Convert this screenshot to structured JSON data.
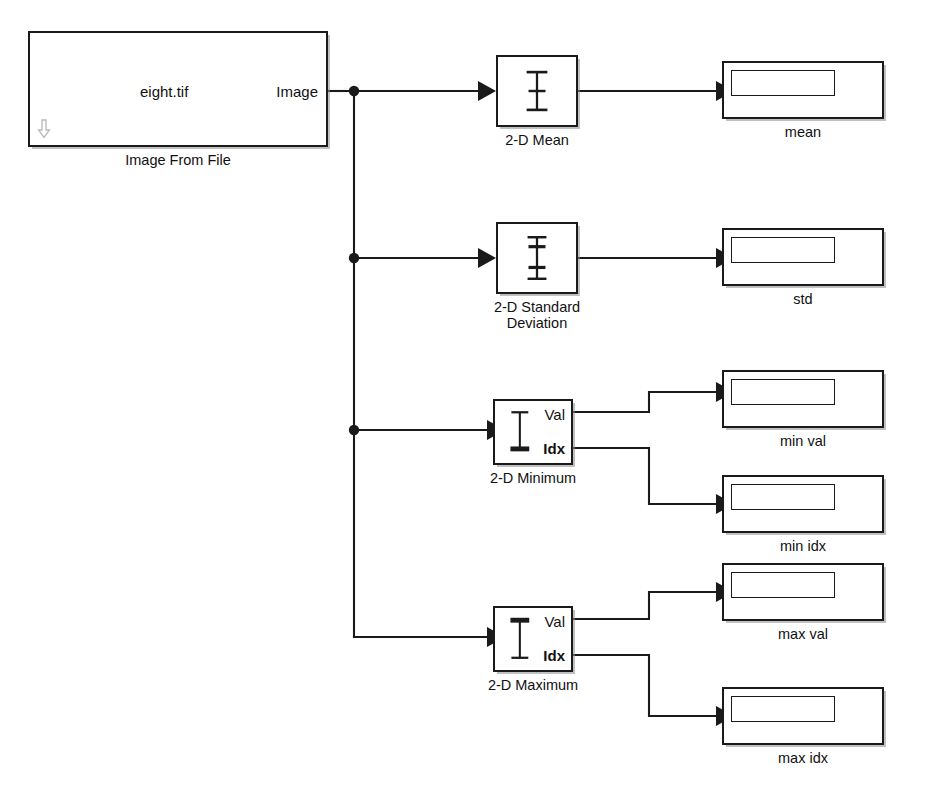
{
  "diagram": {
    "background_color": "#ffffff",
    "line_color": "#1a1a1a"
  },
  "source_block": {
    "name": "Image From File",
    "file_value": "eight.tif",
    "output_port_label": "Image",
    "caption": "Image From File",
    "decoration_icon": "down-arrow-icon"
  },
  "stat_blocks": [
    {
      "id": "mean",
      "caption": "2-D Mean",
      "icon": "i-beam-plain-icon",
      "ports": []
    },
    {
      "id": "std",
      "caption": "2-D Standard\nDeviation",
      "icon": "i-beam-double-tick-icon",
      "ports": []
    },
    {
      "id": "min",
      "caption": "2-D Minimum",
      "icon": "i-beam-bold-bottom-icon",
      "ports": [
        "Val",
        "Idx"
      ]
    },
    {
      "id": "max",
      "caption": "2-D Maximum",
      "icon": "i-beam-bold-top-icon",
      "ports": [
        "Val",
        "Idx"
      ]
    }
  ],
  "display_blocks": [
    {
      "id": "mean",
      "caption": "mean",
      "value": ""
    },
    {
      "id": "std",
      "caption": "std",
      "value": ""
    },
    {
      "id": "min_val",
      "caption": "min val",
      "value": ""
    },
    {
      "id": "min_idx",
      "caption": "min idx",
      "value": ""
    },
    {
      "id": "max_val",
      "caption": "max val",
      "value": ""
    },
    {
      "id": "max_idx",
      "caption": "max idx",
      "value": ""
    }
  ],
  "port_labels": {
    "val": "Val",
    "idx": "Idx"
  },
  "signal_lines": {
    "branch_count": 3,
    "junction_x": 354,
    "junction_ys": [
      91,
      258,
      430
    ]
  }
}
